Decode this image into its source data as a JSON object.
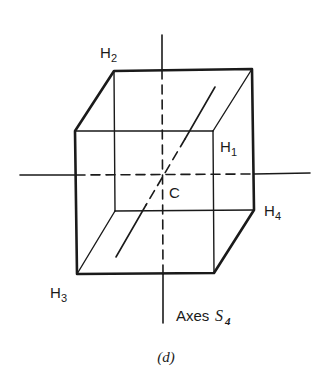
{
  "figure": {
    "caption": "(d)",
    "axes_label": {
      "text": "Axes ",
      "symbol": "S",
      "subscript": "4"
    },
    "center_label": "C",
    "vertices": [
      {
        "name": "H",
        "sub": "1"
      },
      {
        "name": "H",
        "sub": "2"
      },
      {
        "name": "H",
        "sub": "3"
      },
      {
        "name": "H",
        "sub": "4"
      }
    ],
    "colors": {
      "stroke": "#1a1a1a",
      "background": "#ffffff"
    }
  }
}
